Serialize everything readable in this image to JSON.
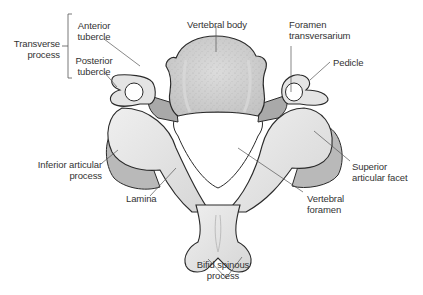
{
  "figure": {
    "colors": {
      "bone_fill": "#e6e6e6",
      "bone_shade": "#c8c8c8",
      "bone_dark": "#a9a9a9",
      "outline": "#2a2a2a",
      "leader": "#555555",
      "text": "#333333",
      "background": "#ffffff"
    }
  },
  "labels": {
    "transverse_process": "Transverse\nprocess",
    "anterior_tubercle": "Anterior\ntubercle",
    "posterior_tubercle": "Posterior\ntubercle",
    "vertebral_body": "Vertebral body",
    "foramen_transversarium": "Foramen\ntransversarium",
    "pedicle": "Pedicle",
    "inferior_articular_process": "Inferior articular\nprocess",
    "superior_articular_facet": "Superior\narticular facet",
    "lamina": "Lamina",
    "vertebral_foramen": "Vertebral\nforamen",
    "bifid_spinous_process": "Bifid spinous\nprocess"
  }
}
